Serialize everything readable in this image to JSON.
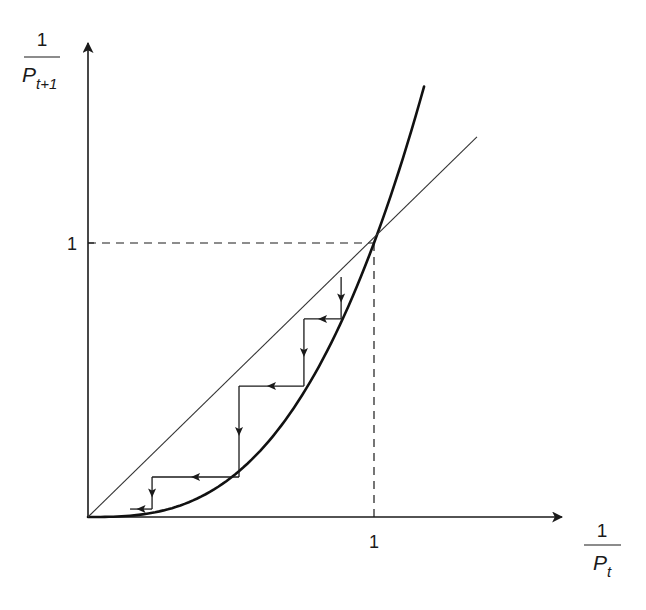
{
  "chart_data": {
    "type": "line",
    "title": "",
    "xlabel": {
      "numerator": "1",
      "base": "P",
      "subscript": "t"
    },
    "ylabel": {
      "numerator": "1",
      "base": "P",
      "subscript": "t+1"
    },
    "x_ticks": [
      {
        "value": 1,
        "label": "1"
      }
    ],
    "y_ticks": [
      {
        "value": 1,
        "label": "1"
      }
    ],
    "xlim": [
      0,
      1.6
    ],
    "ylim": [
      0,
      1.6
    ],
    "grid": false,
    "legend": "none",
    "series": [
      {
        "name": "map-curve",
        "kind": "power-curve",
        "exponent": 2.8,
        "x_range": [
          0,
          1.175
        ],
        "style": "thick"
      },
      {
        "name": "45-degree-line",
        "kind": "identity",
        "x_range": [
          0,
          1.36
        ],
        "style": "thin"
      }
    ],
    "reference_lines": [
      {
        "name": "x-equals-1",
        "x": 1,
        "y_range": [
          0,
          1
        ],
        "style": "dashed"
      },
      {
        "name": "y-equals-1",
        "y": 1,
        "x_range": [
          0,
          1
        ],
        "style": "dashed"
      }
    ],
    "fixed_point": {
      "x": 1,
      "y": 1
    },
    "cobweb_path": [
      [
        0.885,
        0.876
      ],
      [
        0.885,
        0.723
      ],
      [
        0.755,
        0.723
      ],
      [
        0.755,
        0.478
      ],
      [
        0.528,
        0.478
      ],
      [
        0.528,
        0.146
      ],
      [
        0.224,
        0.146
      ],
      [
        0.224,
        0.029
      ],
      [
        0.147,
        0.029
      ]
    ]
  }
}
